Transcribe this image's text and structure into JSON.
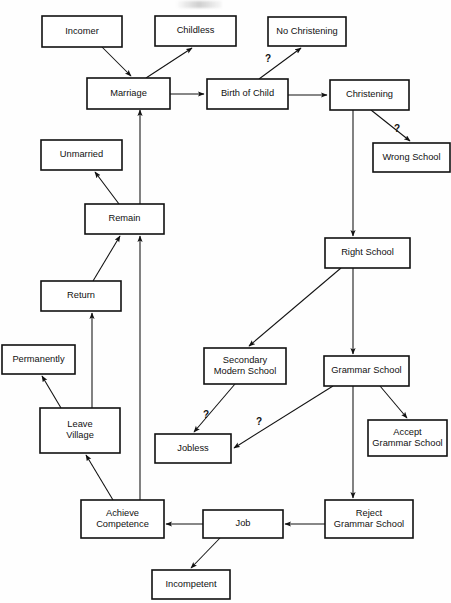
{
  "diagram": {
    "type": "flowchart",
    "width": 451,
    "height": 603,
    "stroke_color": "#111111",
    "fill_color": "#ffffff",
    "background": "#fefefe",
    "nodes": [
      {
        "id": "incomer",
        "label": "Incomer",
        "lines": [
          "Incomer"
        ],
        "x": 42,
        "y": 16,
        "w": 80,
        "h": 31
      },
      {
        "id": "childless",
        "label": "Childless",
        "lines": [
          "Childless"
        ],
        "x": 155,
        "y": 16,
        "w": 81,
        "h": 30
      },
      {
        "id": "nochrist",
        "label": "No Christening",
        "lines": [
          "No Christening"
        ],
        "x": 268,
        "y": 17,
        "w": 78,
        "h": 29
      },
      {
        "id": "marriage",
        "label": "Marriage",
        "lines": [
          "Marriage"
        ],
        "x": 87,
        "y": 78,
        "w": 83,
        "h": 31
      },
      {
        "id": "birth",
        "label": "Birth of Child",
        "lines": [
          "Birth of Child"
        ],
        "x": 207,
        "y": 79,
        "w": 81,
        "h": 30
      },
      {
        "id": "christening",
        "label": "Christening",
        "lines": [
          "Christening"
        ],
        "x": 330,
        "y": 80,
        "w": 79,
        "h": 30
      },
      {
        "id": "unmarried",
        "label": "Unmarried",
        "lines": [
          "Unmarried"
        ],
        "x": 41,
        "y": 140,
        "w": 81,
        "h": 30
      },
      {
        "id": "wrongschool",
        "label": "Wrong School",
        "lines": [
          "Wrong School"
        ],
        "x": 373,
        "y": 143,
        "w": 77,
        "h": 29
      },
      {
        "id": "remain",
        "label": "Remain",
        "lines": [
          "Remain"
        ],
        "x": 85,
        "y": 204,
        "w": 79,
        "h": 30
      },
      {
        "id": "rightschool",
        "label": "Right School",
        "lines": [
          "Right School"
        ],
        "x": 325,
        "y": 238,
        "w": 85,
        "h": 30
      },
      {
        "id": "return",
        "label": "Return",
        "lines": [
          "Return"
        ],
        "x": 41,
        "y": 281,
        "w": 80,
        "h": 30
      },
      {
        "id": "permanently",
        "label": "Permanently",
        "lines": [
          "Permanently"
        ],
        "x": 2,
        "y": 345,
        "w": 73,
        "h": 29
      },
      {
        "id": "secondary",
        "label": "Secondary Modern School",
        "lines": [
          "Secondary",
          "Modern School"
        ],
        "x": 204,
        "y": 348,
        "w": 82,
        "h": 36
      },
      {
        "id": "grammar",
        "label": "Grammar School",
        "lines": [
          "Grammar School"
        ],
        "x": 324,
        "y": 356,
        "w": 85,
        "h": 30
      },
      {
        "id": "leave",
        "label": "Leave Village",
        "lines": [
          "Leave",
          "Village"
        ],
        "x": 40,
        "y": 408,
        "w": 80,
        "h": 45
      },
      {
        "id": "jobless",
        "label": "Jobless",
        "lines": [
          "Jobless"
        ],
        "x": 155,
        "y": 434,
        "w": 76,
        "h": 29
      },
      {
        "id": "accept",
        "label": "Accept Grammar School",
        "lines": [
          "Accept",
          "Grammar School"
        ],
        "x": 368,
        "y": 420,
        "w": 79,
        "h": 36
      },
      {
        "id": "achieve",
        "label": "Achieve Competence",
        "lines": [
          "Achieve",
          "Competence"
        ],
        "x": 81,
        "y": 500,
        "w": 83,
        "h": 38
      },
      {
        "id": "job",
        "label": "Job",
        "lines": [
          "Job"
        ],
        "x": 203,
        "y": 510,
        "w": 80,
        "h": 28
      },
      {
        "id": "reject",
        "label": "Reject Grammar School",
        "lines": [
          "Reject",
          "Grammar School"
        ],
        "x": 325,
        "y": 500,
        "w": 88,
        "h": 38
      },
      {
        "id": "incompetent",
        "label": "Incompetent",
        "lines": [
          "Incompetent"
        ],
        "x": 152,
        "y": 570,
        "w": 78,
        "h": 29
      }
    ],
    "edges": [
      {
        "id": "incomer-marriage",
        "from": "Incomer",
        "to": "Marriage",
        "points": "102,47 131,76",
        "label": ""
      },
      {
        "id": "marriage-childless",
        "from": "Marriage",
        "to": "Childless",
        "points": "146,78 192,48",
        "label": ""
      },
      {
        "id": "marriage-birth",
        "from": "Marriage",
        "to": "Birth of Child",
        "points": "170,94 204,94",
        "label": ""
      },
      {
        "id": "birth-nochristening",
        "from": "Birth of Child",
        "to": "No Christening",
        "points": "259,79 301,48",
        "label": "?"
      },
      {
        "id": "birth-christening",
        "from": "Birth of Child",
        "to": "Christening",
        "points": "288,95 327,95",
        "label": ""
      },
      {
        "id": "christening-wrong",
        "from": "Christening",
        "to": "Wrong School",
        "points": "371,110 410,141",
        "label": "?"
      },
      {
        "id": "christening-right",
        "from": "Christening",
        "to": "Right School",
        "points": "353,110 353,236",
        "label": ""
      },
      {
        "id": "remain-unmarried",
        "from": "Remain",
        "to": "Unmarried",
        "points": "119,204 95,172",
        "label": ""
      },
      {
        "id": "remain-marriage",
        "from": "Remain",
        "to": "Marriage",
        "points": "140,204 140,110",
        "label": ""
      },
      {
        "id": "return-remain",
        "from": "Return",
        "to": "Remain",
        "points": "93,281 120,236",
        "label": ""
      },
      {
        "id": "achieve-remain",
        "from": "Achieve Competence",
        "to": "Remain",
        "points": "140,500 140,236",
        "label": ""
      },
      {
        "id": "leave-permanently",
        "from": "Leave Village",
        "to": "Permanently",
        "points": "61,408 42,376",
        "label": ""
      },
      {
        "id": "leave-return",
        "from": "Leave Village",
        "to": "Return",
        "points": "92,408 92,313",
        "label": ""
      },
      {
        "id": "achieve-leave",
        "from": "Achieve Competence",
        "to": "Leave Village",
        "points": "113,500 86,455",
        "label": ""
      },
      {
        "id": "rightschool-secondary",
        "from": "Right School",
        "to": "Secondary Modern School",
        "points": "341,268 249,346",
        "label": ""
      },
      {
        "id": "rightschool-grammar",
        "from": "Right School",
        "to": "Grammar School",
        "points": "353,268 353,354",
        "label": ""
      },
      {
        "id": "secondary-jobless",
        "from": "Secondary Modern School",
        "to": "Jobless",
        "points": "235,384 194,432",
        "label": "?"
      },
      {
        "id": "grammar-jobless",
        "from": "Grammar School",
        "to": "Jobless",
        "points": "333,386 234,448",
        "label": "?"
      },
      {
        "id": "grammar-accept",
        "from": "Grammar School",
        "to": "Accept Grammar School",
        "points": "380,386 407,418",
        "label": ""
      },
      {
        "id": "grammar-reject",
        "from": "Grammar School",
        "to": "Reject Grammar School",
        "points": "353,386 353,498",
        "label": ""
      },
      {
        "id": "reject-job",
        "from": "Reject Grammar School",
        "to": "Job",
        "points": "325,524 285,524",
        "label": ""
      },
      {
        "id": "job-achieve",
        "from": "Job",
        "to": "Achieve Competence",
        "points": "203,524 166,524",
        "label": ""
      },
      {
        "id": "job-incompetent",
        "from": "Job",
        "to": "Incompetent",
        "points": "220,538 191,568",
        "label": ""
      }
    ],
    "edge_labels": [
      {
        "id": "q-birth-nochristening",
        "text": "?",
        "x": 268,
        "y": 62
      },
      {
        "id": "q-christening-wrong",
        "text": "?",
        "x": 397,
        "y": 132
      },
      {
        "id": "q-secondary-jobless",
        "text": "?",
        "x": 206,
        "y": 418
      },
      {
        "id": "q-grammar-jobless",
        "text": "?",
        "x": 259,
        "y": 425
      }
    ]
  }
}
